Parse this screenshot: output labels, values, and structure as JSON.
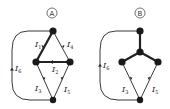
{
  "diagrams": [
    {
      "id": "A",
      "label": "A",
      "currents": {
        "i1": {
          "main": "I",
          "sub": "1"
        },
        "i2": {
          "main": "I",
          "sub": "2"
        },
        "i3": {
          "main": "I",
          "sub": "3"
        },
        "i4": {
          "main": "I",
          "sub": "4"
        },
        "i5": {
          "main": "I",
          "sub": "5"
        },
        "i6": {
          "main": "I",
          "sub": "6"
        }
      }
    },
    {
      "id": "B",
      "label": "B",
      "currents": {
        "i3": {
          "main": "I",
          "sub": "3"
        },
        "i5": {
          "main": "I",
          "sub": "5"
        },
        "i6": {
          "main": "I",
          "sub": "6"
        }
      }
    }
  ],
  "colors": {
    "ink": "#222222",
    "node": "#1a1a1a",
    "background": "#ffffff"
  }
}
